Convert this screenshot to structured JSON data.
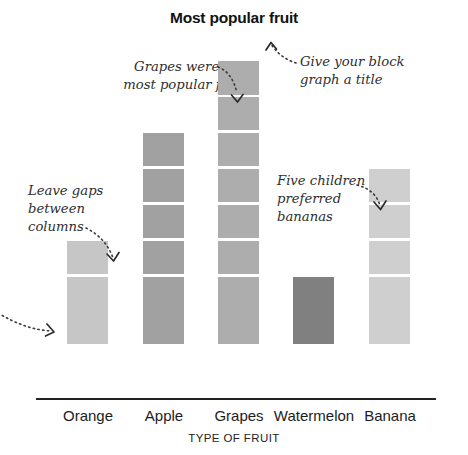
{
  "chart": {
    "title": "Most popular fruit",
    "axis_title": "TYPE OF FRUIT"
  },
  "annotations": {
    "grapes": "Grapes were the\nmost popular fruit",
    "title_hint": "Give your block\ngraph a title",
    "gaps": "Leave gaps\nbetween\ncolumns",
    "bananas": "Five children\npreferred\nbananas"
  },
  "chart_data": {
    "type": "bar",
    "title": "Most popular fruit",
    "subtitle": "",
    "xlabel": "TYPE OF FRUIT",
    "ylabel": "",
    "categories": [
      "Orange",
      "Apple",
      "Grapes",
      "Watermelon",
      "Banana"
    ],
    "values": [
      3,
      6,
      8,
      2,
      5
    ],
    "ylim": [
      0,
      8
    ],
    "grid": false,
    "legend": "none",
    "note": "Pictogram-style block graph: each column is built from stacked unit blocks separated by white gaps; one block equals one child.",
    "bar_colors": [
      "#c6c6c6",
      "#a1a1a1",
      "#adadad",
      "#808080",
      "#cfcfcf"
    ],
    "annotations": [
      {
        "text": "Grapes were the most popular fruit",
        "points_to": "Grapes"
      },
      {
        "text": "Give your block graph a title",
        "points_to": "Most popular fruit"
      },
      {
        "text": "Leave gaps between columns",
        "points_to": "Orange"
      },
      {
        "text": "Five children preferred bananas",
        "points_to": "Banana"
      }
    ]
  },
  "colors": {
    "orange": "#c6c6c6",
    "apple": "#a1a1a1",
    "grapes": "#adadad",
    "watermelon": "#808080",
    "banana": "#cfcfcf",
    "axis": "#222222",
    "text": "#1a1a1a",
    "note_text": "#2e2e2e"
  }
}
